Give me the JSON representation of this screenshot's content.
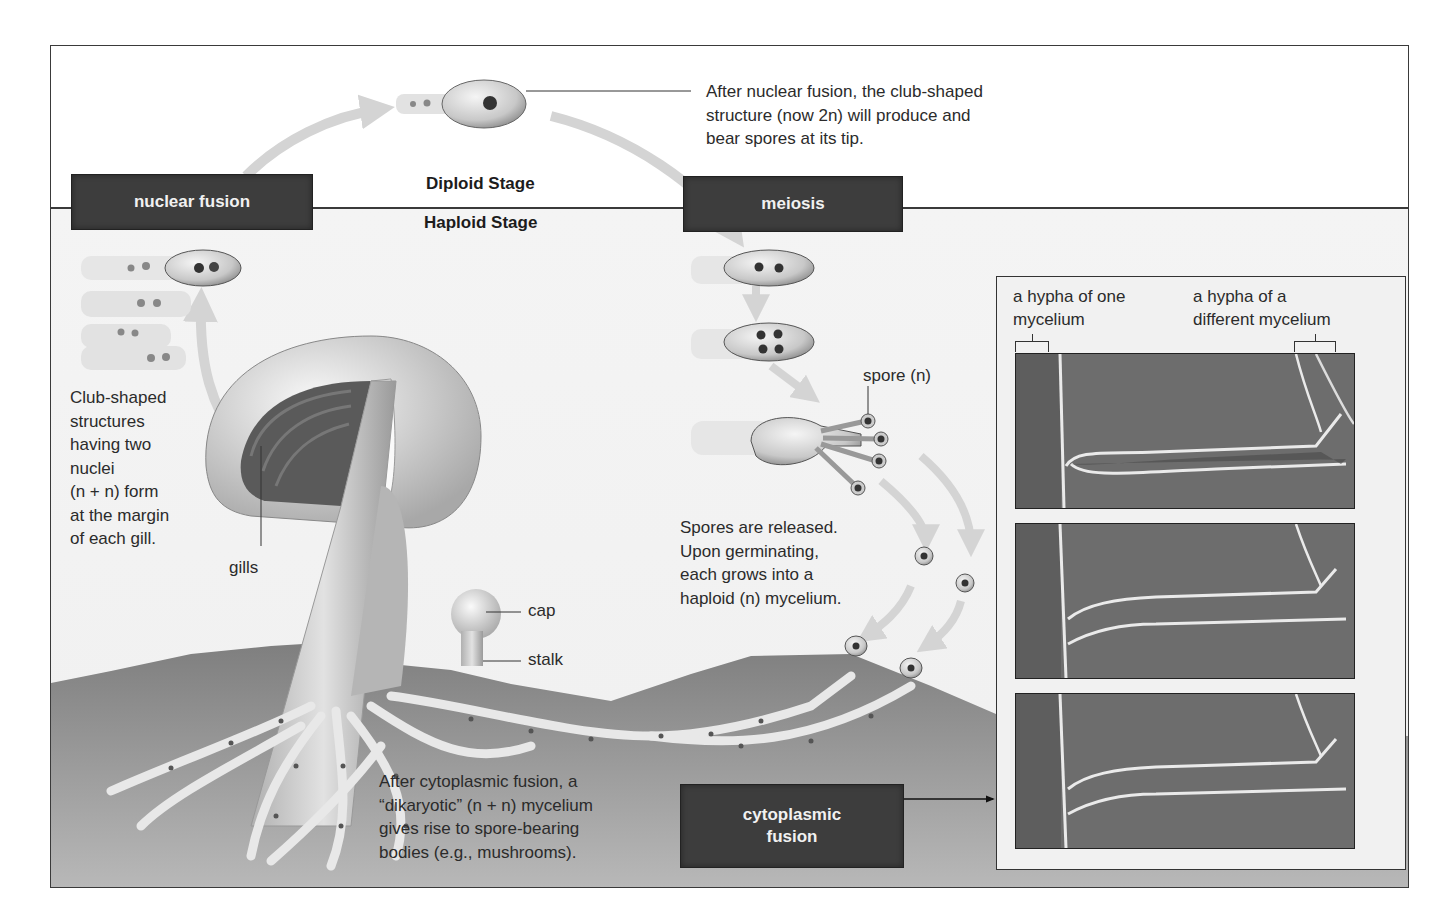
{
  "diagram": {
    "stages": {
      "diploid": "Diploid Stage",
      "haploid": "Haploid Stage"
    },
    "boxes": {
      "nuclear_fusion": "nuclear fusion",
      "meiosis": "meiosis",
      "cytoplasmic_fusion_line1": "cytoplasmic",
      "cytoplasmic_fusion_line2": "fusion"
    },
    "captions": {
      "after_nuclear_fusion": [
        "After nuclear fusion, the club-shaped",
        "structure (now 2n) will produce and",
        "bear spores at its tip."
      ],
      "club_shaped": [
        "Club-shaped",
        "structures",
        "having two",
        "nuclei",
        "(n + n) form",
        "at the margin",
        "of each gill."
      ],
      "spores_released": [
        "Spores are released.",
        "Upon germinating,",
        "each grows into a",
        "haploid (n) mycelium."
      ],
      "after_cytoplasmic_fusion": [
        "After cytoplasmic fusion, a",
        "“dikaryotic” (n + n) mycelium",
        "gives rise to spore-bearing",
        "bodies (e.g., mushrooms)."
      ]
    },
    "labels": {
      "gills": "gills",
      "cap": "cap",
      "stalk": "stalk",
      "spore": "spore (n)",
      "hypha_one_line1": "a hypha of one",
      "hypha_one_line2": "mycelium",
      "hypha_diff_line1": "a hypha of a",
      "hypha_diff_line2": "different mycelium"
    },
    "colors": {
      "box_fill": "#3d3d3d",
      "box_text": "#f1f1f1",
      "arrow": "#d4d4d4",
      "soil": "#8a8a8a",
      "frame": "#3a3a3a"
    }
  }
}
